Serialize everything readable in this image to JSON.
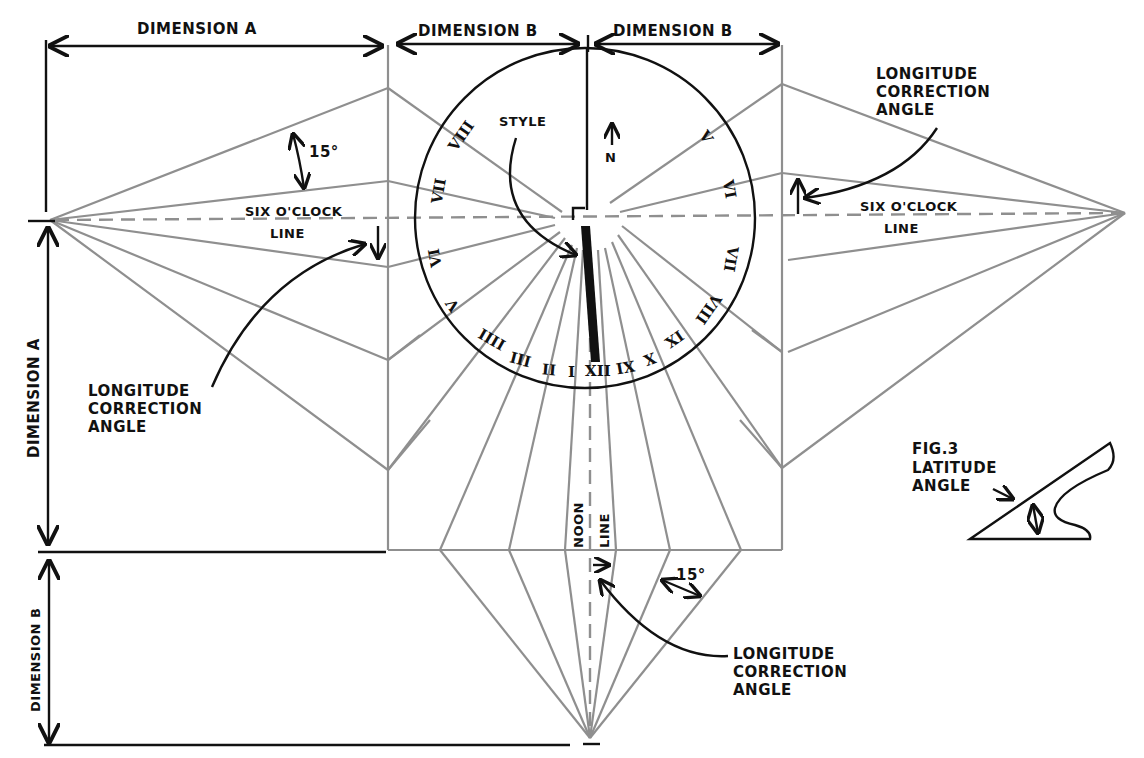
{
  "diagram": {
    "type": "sundial-construction-drawing",
    "colors": {
      "ink": "#111111",
      "construction_lines": "#8f8f8f",
      "background": "#ffffff"
    },
    "dimensions": {
      "top_left": "DIMENSION A",
      "top_center_left": "DIMENSION B",
      "top_center_right": "DIMENSION B",
      "left_vertical": "DIMENSION A",
      "bottom_left_vertical": "DIMENSION B"
    },
    "labels": {
      "style": "STYLE",
      "north": "N",
      "angle_15_top": "15°",
      "angle_15_bottom": "15°",
      "six_oclock_left_line1": "SIX O'CLOCK",
      "six_oclock_left_line2": "LINE",
      "six_oclock_right_line1": "SIX O'CLOCK",
      "six_oclock_right_line2": "LINE",
      "noon_line1": "NOON",
      "noon_line2": "LINE",
      "longitude_left": "LONGITUDE\nCORRECTION\nANGLE",
      "longitude_right": "LONGITUDE\nCORRECTION\nANGLE",
      "longitude_bottom": "LONGITUDE\nCORRECTION\nANGLE",
      "fig3_title": "FIG.3",
      "fig3_caption": "LATITUDE\nANGLE"
    },
    "hour_numerals": {
      "h8_left_top": "VIII",
      "h7_left": "VII",
      "h6_left_below": "VI",
      "h5_left": "V",
      "h4_left": "IIII",
      "h3_left": "III",
      "h2_left": "II",
      "h1_left": "I",
      "h12": "XII",
      "h11": "XI",
      "h10": "X",
      "h9": "IX",
      "h8_right": "VIII",
      "h7_right": "VII",
      "h6_right": "VI",
      "h5_right": "V"
    }
  }
}
